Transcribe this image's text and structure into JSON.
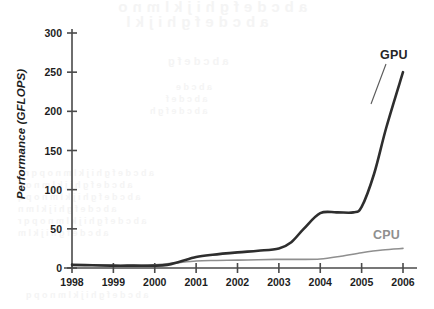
{
  "figure": {
    "background_color": "#ffffff",
    "axis_color": "#4a4a4a"
  },
  "bleed_through": {
    "note": "illegible mirrored show-through text from reverse of scanned page",
    "lines": [
      "a b c d e f g h i j k l m n o",
      "a b c d e f g h i j k l",
      "a b c d e f g",
      "a b c d e",
      "a b c d e f",
      "a b c d e f g h",
      "a b c d e f g h i j k l m n o p q r s",
      "a b c d e f g h i j k l m n o p",
      "a b c d e f g h i j k l m n o p q",
      "a b c d e f g h i j k l m n",
      "a b c d e f g h i j k l m n o p q r",
      "a b c d e f g h i j k l m",
      "a b c d e f g h i j k l m n o p q"
    ]
  },
  "chart_data": {
    "type": "line",
    "title": "",
    "xlabel": "",
    "ylabel": "Performance (GFLOPS)",
    "x": [
      1998,
      1999,
      2000,
      2001,
      2002,
      2003,
      2004,
      2005,
      2006
    ],
    "xtick_labels": [
      "1998",
      "1999",
      "2000",
      "2001",
      "2002",
      "2003",
      "2004",
      "2005",
      "2006"
    ],
    "ytick_labels": [
      "0",
      "50",
      "100",
      "150",
      "200",
      "250",
      "300"
    ],
    "yticks": [
      0,
      50,
      100,
      150,
      200,
      250,
      300
    ],
    "xlim": [
      1998,
      2006
    ],
    "ylim": [
      0,
      300
    ],
    "grid": false,
    "legend": "inline-labels",
    "series": [
      {
        "name": "GPU",
        "color": "#2e2e2e",
        "line_width": 2.6,
        "label_position": "top-right",
        "values": [
          4,
          3,
          3,
          14,
          20,
          25,
          70,
          72,
          250
        ],
        "dense_x": [
          1998,
          1998.5,
          1999,
          1999.5,
          2000,
          2000.3,
          2000.6,
          2001,
          2001.4,
          2002,
          2002.5,
          2003,
          2003.3,
          2003.6,
          2004,
          2004.4,
          2004.8,
          2005,
          2005.3,
          2005.6,
          2006
        ],
        "dense_y": [
          4,
          3.5,
          3,
          3,
          3,
          4,
          8,
          14,
          17,
          20,
          22,
          25,
          33,
          50,
          70,
          71,
          71,
          78,
          120,
          180,
          250
        ]
      },
      {
        "name": "CPU",
        "color": "#8f8f8f",
        "line_width": 1.6,
        "label_position": "bottom-right",
        "values": [
          4,
          3,
          4,
          9,
          10,
          11,
          11,
          18,
          25
        ],
        "dense_x": [
          1998,
          1999,
          2000,
          2000.5,
          2001,
          2001.5,
          2002,
          2002.5,
          2003,
          2003.5,
          2004,
          2004.5,
          2005,
          2005.5,
          2006
        ],
        "dense_y": [
          4,
          3,
          4,
          6.5,
          9,
          9.6,
          10,
          10.5,
          11,
          11,
          11.5,
          15,
          19.5,
          23,
          25
        ]
      }
    ]
  }
}
